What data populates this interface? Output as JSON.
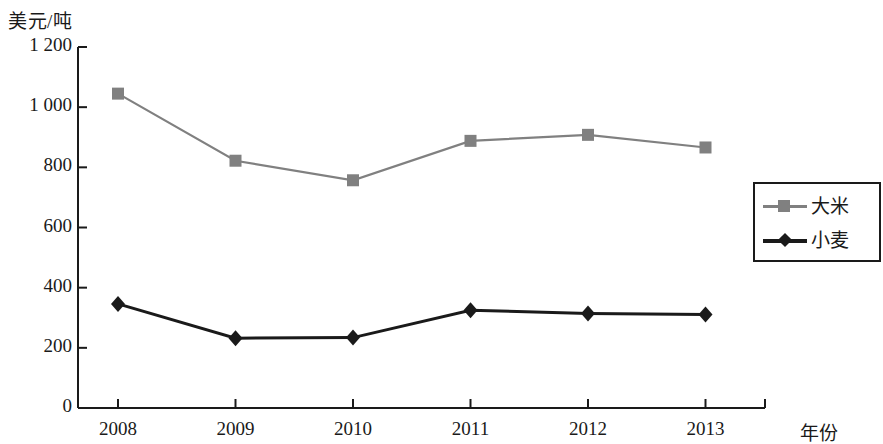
{
  "chart_data": {
    "type": "line",
    "title": "",
    "subtitle": "",
    "ylabel": "美元/吨",
    "xlabel": "年份",
    "categories": [
      "2008",
      "2009",
      "2010",
      "2011",
      "2012",
      "2013"
    ],
    "ylim": [
      0,
      1200
    ],
    "ytick_labels": [
      "0",
      "200",
      "400",
      "600",
      "800",
      "1 000",
      "1 200"
    ],
    "ytick_values": [
      0,
      200,
      400,
      600,
      800,
      1000,
      1200
    ],
    "grid": false,
    "legend_position": "right",
    "series": [
      {
        "name": "大米",
        "color": "#808080",
        "marker": "square",
        "values": [
          1045,
          822,
          757,
          888,
          908,
          866
        ]
      },
      {
        "name": "小麦",
        "color": "#1a1a1a",
        "marker": "diamond",
        "values": [
          346,
          232,
          234,
          325,
          314,
          311
        ]
      }
    ]
  },
  "legend": {
    "items": [
      {
        "label": "大米"
      },
      {
        "label": "小麦"
      }
    ]
  },
  "axes": {
    "y_unit": "美元/吨",
    "x_title": "年份"
  },
  "colors": {
    "rice": "#808080",
    "wheat": "#1a1a1a",
    "axis": "#1a1a1a",
    "background": "#ffffff"
  }
}
